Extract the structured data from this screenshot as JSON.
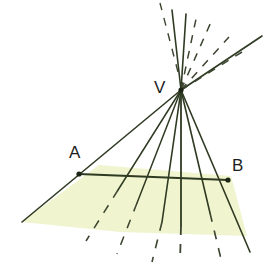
{
  "figure": {
    "canvas": {
      "width": 267,
      "height": 265,
      "background": "#ffffff"
    },
    "colors": {
      "plane_fill": "#f0f4cf",
      "plane_fill_alt": "#eef2c8",
      "line": "#2f3a22",
      "line_dashed": "#3b4530",
      "point": "#1c2414",
      "label": "#1d1d1d"
    },
    "labels": [
      {
        "id": "V",
        "text": "V",
        "x": 154,
        "y": 79,
        "role": "vertex-label"
      },
      {
        "id": "A",
        "text": "A",
        "x": 69,
        "y": 144,
        "role": "point-label"
      },
      {
        "id": "B",
        "text": "B",
        "x": 232,
        "y": 157,
        "role": "point-label"
      }
    ],
    "points": [
      {
        "id": "V",
        "x": 181,
        "y": 90,
        "marked": true
      },
      {
        "id": "A",
        "x": 79,
        "y": 174,
        "marked": true
      },
      {
        "id": "B",
        "x": 228,
        "y": 180,
        "marked": true
      }
    ],
    "plane": {
      "name": "shaded-plane",
      "fill": "#f0f4cf",
      "vertices": [
        [
          22,
          222
        ],
        [
          99,
          165
        ],
        [
          231,
          176
        ],
        [
          247,
          236
        ],
        [
          120,
          232
        ]
      ],
      "outline_visible": false
    },
    "segment_AB": {
      "name": "segment-ab",
      "from": [
        79,
        174
      ],
      "to": [
        228,
        180
      ],
      "style": "solid",
      "width": 2.0
    },
    "lower_rays": [
      {
        "id": "ray-1",
        "from": [
          181,
          90
        ],
        "to": [
          22,
          222
        ],
        "style": "solid",
        "width": 1.6
      },
      {
        "id": "ray-2",
        "from": [
          181,
          90
        ],
        "to": [
          86,
          241
        ],
        "style": "mixed",
        "width": 1.5,
        "solid_until": [
          118,
          190
        ],
        "dash_from": [
          118,
          190
        ]
      },
      {
        "id": "ray-3",
        "from": [
          181,
          90
        ],
        "to": [
          117,
          254
        ],
        "style": "mixed",
        "width": 1.5,
        "solid_until": [
          137,
          203
        ],
        "dash_from": [
          137,
          203
        ]
      },
      {
        "id": "ray-4",
        "from": [
          181,
          90
        ],
        "to": [
          152,
          262
        ],
        "style": "mixed",
        "width": 1.6,
        "solid_until": [
          162,
          222
        ],
        "dash_from": [
          162,
          222
        ]
      },
      {
        "id": "ray-5",
        "from": [
          181,
          90
        ],
        "to": [
          180,
          262
        ],
        "style": "mixed",
        "width": 1.8,
        "solid_until": [
          181,
          226
        ],
        "dash_from": [
          181,
          226
        ]
      },
      {
        "id": "ray-6",
        "from": [
          181,
          90
        ],
        "to": [
          221,
          259
        ],
        "style": "mixed",
        "width": 1.6,
        "solid_until": [
          210,
          213
        ],
        "dash_from": [
          210,
          213
        ]
      },
      {
        "id": "ray-7",
        "from": [
          181,
          90
        ],
        "to": [
          250,
          252
        ],
        "style": "solid",
        "width": 1.6
      }
    ],
    "upper_rays": [
      {
        "id": "up-1",
        "from": [
          181,
          90
        ],
        "to": [
          172,
          10
        ],
        "style": "solid",
        "width": 1.6
      },
      {
        "id": "up-2",
        "from": [
          181,
          90
        ],
        "to": [
          186,
          14
        ],
        "style": "solid",
        "width": 1.6
      },
      {
        "id": "up-3",
        "from": [
          181,
          90
        ],
        "to": [
          196,
          19
        ],
        "style": "dashed",
        "width": 1.5
      },
      {
        "id": "up-4",
        "from": [
          181,
          90
        ],
        "to": [
          211,
          22
        ],
        "style": "dashed",
        "width": 1.5
      },
      {
        "id": "up-5",
        "from": [
          181,
          90
        ],
        "to": [
          229,
          37
        ],
        "style": "dashed",
        "width": 1.5
      },
      {
        "id": "up-6",
        "from": [
          181,
          90
        ],
        "to": [
          242,
          52
        ],
        "style": "dashed",
        "width": 1.5
      },
      {
        "id": "up-7",
        "from": [
          181,
          90
        ],
        "to": [
          262,
          36
        ],
        "style": "solid",
        "width": 1.6
      },
      {
        "id": "up-8",
        "from": [
          181,
          90
        ],
        "to": [
          160,
          3
        ],
        "style": "dashed",
        "width": 1.4
      }
    ]
  }
}
